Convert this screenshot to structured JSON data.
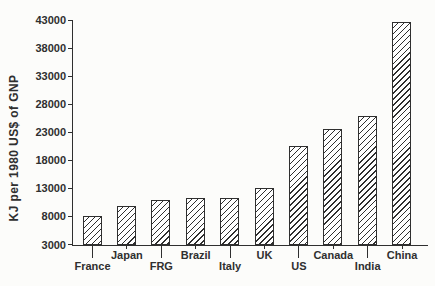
{
  "colors": {
    "ink": "#2f2f2f",
    "paper": "#fcfcfa",
    "bar_fill": "#ffffff"
  },
  "chart_data": {
    "type": "bar",
    "title": "",
    "xlabel": "",
    "ylabel": "KJ per 1980 US$ of GNP",
    "categories": [
      "France",
      "Japan",
      "FRG",
      "Brazil",
      "Italy",
      "UK",
      "US",
      "Canada",
      "India",
      "China"
    ],
    "values": [
      8200,
      9900,
      11000,
      11300,
      11400,
      13100,
      20600,
      23700,
      25900,
      42800
    ],
    "ylim": [
      3000,
      43000
    ],
    "yticks": [
      3000,
      8000,
      13000,
      18000,
      23000,
      28000,
      33000,
      38000,
      43000
    ],
    "grid": false,
    "legend": "none",
    "bar_style": "diagonal-hatch",
    "staggered_x_labels": true
  }
}
